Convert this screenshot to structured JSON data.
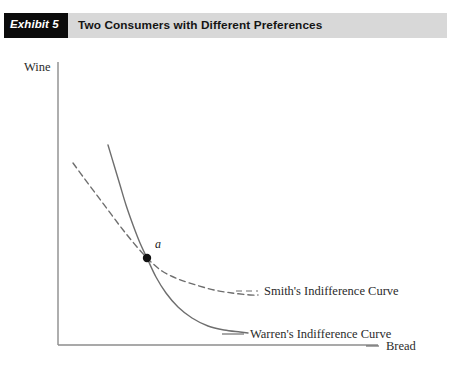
{
  "header": {
    "tag_label": "Exhibit 5",
    "title": "Two Consumers with Different Preferences",
    "tag_bg": "#0b0b0b",
    "tag_fg": "#ffffff",
    "banner_bg": "#d8d8d8",
    "title_fg": "#141414"
  },
  "chart_data": {
    "type": "line",
    "title": "Two Consumers with Different Preferences",
    "xlabel": "Bread",
    "ylabel": "Wine",
    "grid": false,
    "axis_ticks": false,
    "legend_position": "inline-right-of-curve-ends",
    "axis_color": "#8c8c8c",
    "curve_color": "#6e6e6e",
    "point_color": "#111111",
    "series": [
      {
        "name": "Smith's Indifference Curve",
        "style": "dashed",
        "label": "Smith's Indifference Curve",
        "label_x": 264,
        "label_y": 250,
        "leader": [
          [
            236,
            246
          ],
          [
            258,
            246
          ]
        ],
        "points": [
          [
            73,
            118
          ],
          [
            84,
            133
          ],
          [
            96,
            149
          ],
          [
            108,
            165
          ],
          [
            120,
            181
          ],
          [
            132,
            196
          ],
          [
            147,
            213
          ],
          [
            162,
            226
          ],
          [
            178,
            234
          ],
          [
            196,
            240
          ],
          [
            214,
            245
          ],
          [
            232,
            248
          ],
          [
            250,
            250
          ],
          [
            258,
            250
          ]
        ]
      },
      {
        "name": "Warren's Indifference Curve",
        "style": "solid",
        "label": "Warren's Indifference Curve",
        "label_x": 250,
        "label_y": 293,
        "leader": [
          [
            222,
            289
          ],
          [
            244,
            289
          ]
        ],
        "points": [
          [
            108,
            100
          ],
          [
            114,
            120
          ],
          [
            120,
            140
          ],
          [
            126,
            160
          ],
          [
            133,
            180
          ],
          [
            140,
            198
          ],
          [
            147,
            213
          ],
          [
            156,
            232
          ],
          [
            166,
            248
          ],
          [
            178,
            262
          ],
          [
            192,
            273
          ],
          [
            208,
            281
          ],
          [
            224,
            285
          ],
          [
            240,
            287
          ],
          [
            248,
            288
          ]
        ]
      }
    ],
    "annotations": [
      {
        "name": "point-a",
        "label": "a",
        "x": 147,
        "y": 213,
        "label_x": 155,
        "label_y": 203,
        "marker": "filled-circle",
        "radius": 4.2
      }
    ],
    "axes": {
      "origin_x": 58,
      "origin_y": 300,
      "y_top": 17,
      "x_right": 378,
      "ylabel_x": 24,
      "ylabel_y": 26,
      "xlabel_x": 386,
      "xlabel_y": 305,
      "xlabel_leader": [
        [
          366,
          301
        ],
        [
          379,
          301
        ]
      ]
    }
  }
}
